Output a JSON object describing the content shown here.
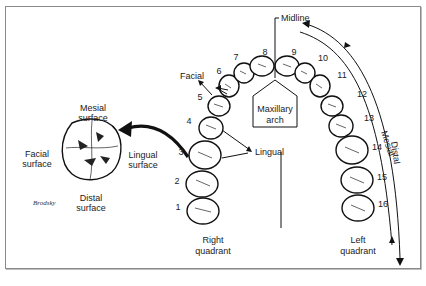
{
  "diagram": {
    "type": "dental-arch-numbering",
    "arch_label": "Maxillary arch",
    "midline_label": "Midline",
    "quadrants": {
      "right": "Right quadrant",
      "left": "Left quadrant"
    },
    "direction_labels": {
      "facial": "Facial",
      "lingual": "Lingual",
      "mesial": "Mesial",
      "distal": "Distal"
    },
    "tooth_detail": {
      "top": "Mesial surface",
      "left": "Facial surface",
      "right": "Lingual surface",
      "bottom": "Distal surface",
      "signature": "Brodsky"
    },
    "teeth": [
      {
        "n": "1",
        "x": 178,
        "y": 210
      },
      {
        "n": "2",
        "x": 177,
        "y": 184
      },
      {
        "n": "3",
        "x": 181,
        "y": 155
      },
      {
        "n": "4",
        "x": 189,
        "y": 124
      },
      {
        "n": "5",
        "x": 200,
        "y": 100
      },
      {
        "n": "6",
        "x": 219,
        "y": 74
      },
      {
        "n": "7",
        "x": 236,
        "y": 60
      },
      {
        "n": "8",
        "x": 265,
        "y": 55
      },
      {
        "n": "9",
        "x": 294,
        "y": 55
      },
      {
        "n": "10",
        "x": 323,
        "y": 61
      },
      {
        "n": "11",
        "x": 342,
        "y": 78
      },
      {
        "n": "12",
        "x": 362,
        "y": 97
      },
      {
        "n": "13",
        "x": 369,
        "y": 121
      },
      {
        "n": "14",
        "x": 377,
        "y": 150
      },
      {
        "n": "15",
        "x": 382,
        "y": 180
      },
      {
        "n": "16",
        "x": 383,
        "y": 207
      }
    ]
  }
}
